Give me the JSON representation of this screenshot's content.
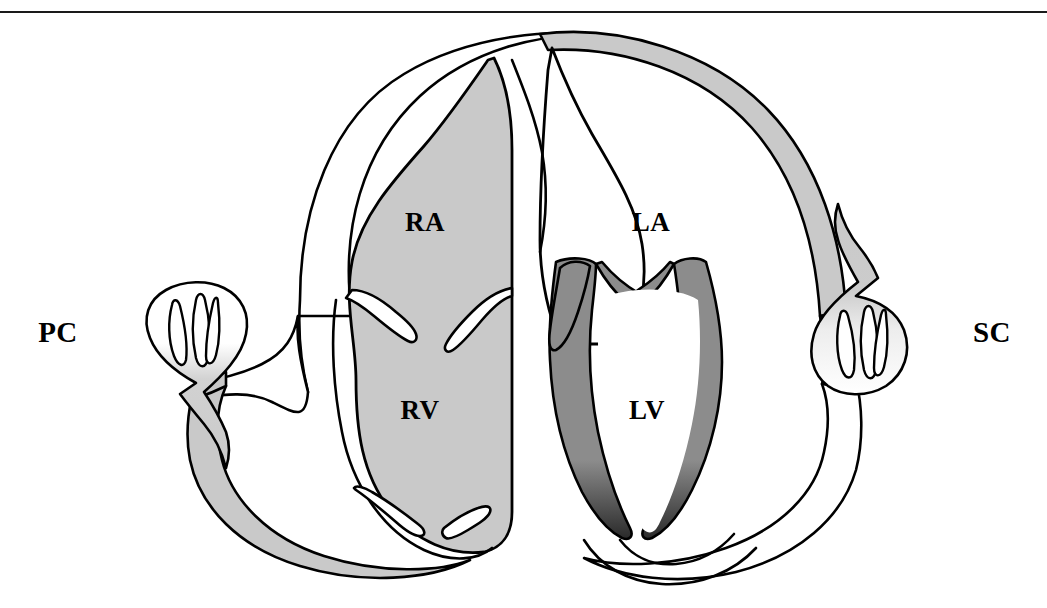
{
  "figure": {
    "type": "anatomical-diagram",
    "has_top_rule": true
  },
  "labels": {
    "pulmonary_circuit": "PC",
    "systemic_circuit": "SC",
    "right_atrium": "RA",
    "left_atrium": "LA",
    "right_ventricle": "RV",
    "left_ventricle": "LV"
  },
  "colors": {
    "outline": "#000000",
    "deoxygenated_fill": "#ffffff",
    "oxygenated_light_fill": "#c9c9c9",
    "oxygenated_dark_fill": "#8c8c8c",
    "background": "#ffffff",
    "rule": "#1a1a1a"
  },
  "structures": [
    {
      "name": "pulmonary-capillary-bed",
      "label": "PC",
      "fill": "gradient-white-to-gray"
    },
    {
      "name": "systemic-capillary-bed",
      "label": "SC",
      "fill": "gradient-gray-to-white"
    },
    {
      "name": "pulmonary-artery",
      "fill": "white"
    },
    {
      "name": "pulmonary-vein",
      "fill": "light-gray"
    },
    {
      "name": "aorta",
      "fill": "light-gray"
    },
    {
      "name": "vena-cava",
      "fill": "white"
    },
    {
      "name": "right-atrium",
      "label": "RA",
      "fill": "light-gray"
    },
    {
      "name": "right-ventricle",
      "label": "RV",
      "fill": "light-gray"
    },
    {
      "name": "left-atrium",
      "label": "LA",
      "fill": "white"
    },
    {
      "name": "left-ventricle",
      "label": "LV",
      "fill": "white"
    },
    {
      "name": "interventricular-septum",
      "fill": "dark-gray"
    },
    {
      "name": "tricuspid-valve",
      "fill": "white"
    },
    {
      "name": "mitral-valve",
      "fill": "white"
    }
  ],
  "label_positions": {
    "pc": {
      "x": 58,
      "y": 335
    },
    "sc": {
      "x": 992,
      "y": 335
    },
    "ra": {
      "x": 425,
      "y": 225
    },
    "la": {
      "x": 651,
      "y": 225
    },
    "rv": {
      "x": 420,
      "y": 413
    },
    "lv": {
      "x": 647,
      "y": 413
    }
  }
}
